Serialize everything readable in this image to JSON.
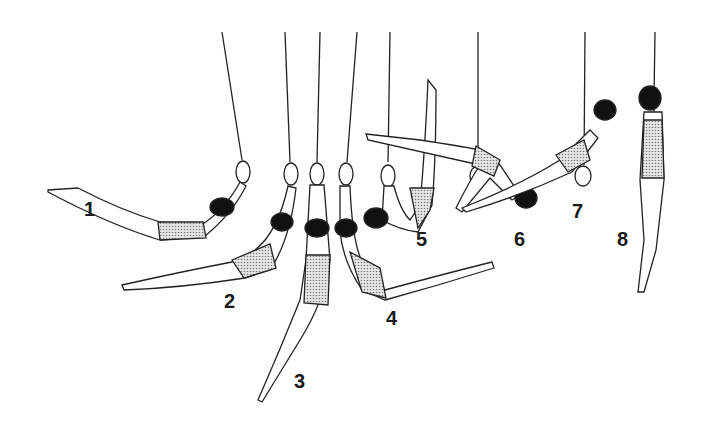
{
  "illustration": {
    "subject": "gymnast swing sequence on rings",
    "positions": [
      {
        "label": "1",
        "x": 84,
        "y": 198
      },
      {
        "label": "2",
        "x": 224,
        "y": 290
      },
      {
        "label": "3",
        "x": 294,
        "y": 370
      },
      {
        "label": "4",
        "x": 386,
        "y": 307
      },
      {
        "label": "5",
        "x": 416,
        "y": 228
      },
      {
        "label": "6",
        "x": 514,
        "y": 228
      },
      {
        "label": "7",
        "x": 572,
        "y": 200
      },
      {
        "label": "8",
        "x": 617,
        "y": 228
      }
    ]
  }
}
